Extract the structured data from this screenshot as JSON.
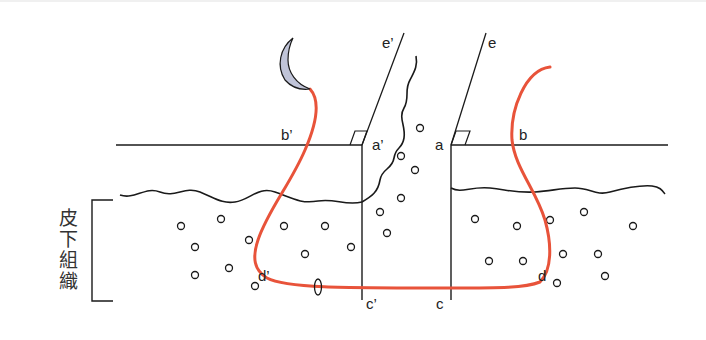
{
  "figure": {
    "type": "suture technique diagram",
    "side_label": "皮下組織",
    "labels": {
      "e_prime": "e’",
      "e": "e",
      "a_prime": "a’",
      "a": "a",
      "b_prime": "b’",
      "b": "b",
      "c_prime": "c’",
      "c": "c",
      "d_prime": "d’",
      "d": "d"
    },
    "colors": {
      "line": "#1a1a1a",
      "suture": "#e8533a",
      "needle_fill": "#c0c4d8",
      "needle_stroke": "#1a1a1a"
    }
  }
}
